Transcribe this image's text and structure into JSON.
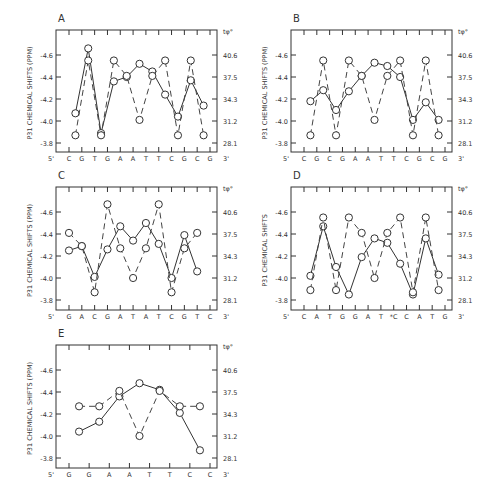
{
  "figure": {
    "left_axis_ticks": [
      "-4.6",
      "-4.4",
      "-4.2",
      "-4.0",
      "-3.8"
    ],
    "right_axis_ticks": [
      "40.6",
      "37.5",
      "34.3",
      "31.2",
      "28.1"
    ],
    "right_axis_label": "tφ°",
    "five_prime": "5'",
    "three_prime": "3'"
  },
  "chart_data": [
    {
      "type": "line",
      "panel": "A",
      "title": "A",
      "ylabel": "P31 CHEMICAL SHIFTS (PPM)",
      "y2label": "tφ°",
      "ylim": [
        -3.75,
        -4.72
      ],
      "y2ticks": [
        40.6,
        37.5,
        34.3,
        31.2,
        28.1
      ],
      "categories": [
        "C",
        "G",
        "T",
        "G",
        "A",
        "A",
        "T",
        "T",
        "C",
        "G",
        "C",
        "G"
      ],
      "series": [
        {
          "name": "P31 chemical shift",
          "style": "solid",
          "x": [
            0.5,
            1.5,
            2.5,
            3.5,
            4.5,
            5.5,
            6.5,
            7.5,
            8.5,
            9.5,
            10.5
          ],
          "values": [
            -4.07,
            -4.66,
            -3.89,
            -4.36,
            -4.4,
            -4.52,
            -4.45,
            -4.24,
            -4.04,
            -4.37,
            -4.14
          ]
        },
        {
          "name": "torsion angle",
          "style": "dashed",
          "x": [
            0.5,
            1.5,
            2.5,
            3.5,
            4.5,
            5.5,
            6.5,
            7.5,
            8.5,
            9.5,
            10.5
          ],
          "values": [
            -3.87,
            -4.55,
            -3.87,
            -4.55,
            -4.41,
            -4.01,
            -4.41,
            -4.55,
            -3.87,
            -4.55,
            -3.87
          ]
        }
      ]
    },
    {
      "type": "line",
      "panel": "B",
      "title": "B",
      "ylabel": "P31 CHEMICAL SHIFTS (PPM)",
      "y2label": "tφ°",
      "ylim": [
        -3.75,
        -4.72
      ],
      "y2ticks": [
        40.6,
        37.5,
        34.3,
        31.2,
        28.1
      ],
      "categories": [
        "C",
        "G",
        "C",
        "G",
        "A",
        "A",
        "T",
        "T",
        "C",
        "G",
        "C",
        "G"
      ],
      "series": [
        {
          "name": "P31 chemical shift",
          "style": "solid",
          "x": [
            0.5,
            1.5,
            2.5,
            3.5,
            4.5,
            5.5,
            6.5,
            7.5,
            8.5,
            9.5,
            10.5
          ],
          "values": [
            -4.18,
            -4.28,
            -4.1,
            -4.27,
            -4.41,
            -4.53,
            -4.5,
            -4.4,
            -4.01,
            -4.17,
            -4.01
          ]
        },
        {
          "name": "torsion angle",
          "style": "dashed",
          "x": [
            0.5,
            1.5,
            2.5,
            3.5,
            4.5,
            5.5,
            6.5,
            7.5,
            8.5,
            9.5,
            10.5
          ],
          "values": [
            -3.87,
            -4.55,
            -3.87,
            -4.55,
            -4.41,
            -4.01,
            -4.41,
            -4.55,
            -3.87,
            -4.55,
            -3.87
          ]
        }
      ]
    },
    {
      "type": "line",
      "panel": "C",
      "title": "C",
      "ylabel": "P31 CHEMICAL SHIFTS (PPM)",
      "y2label": "tφ°",
      "ylim": [
        -3.75,
        -4.72
      ],
      "y2ticks": [
        40.6,
        37.5,
        34.3,
        31.2,
        28.1
      ],
      "categories": [
        "G",
        "A",
        "C",
        "G",
        "A",
        "T",
        "A",
        "T",
        "C",
        "G",
        "T",
        "C"
      ],
      "series": [
        {
          "name": "P31 chemical shift",
          "style": "solid",
          "x": [
            0,
            1,
            2,
            3,
            4,
            5,
            6,
            7,
            8,
            9,
            10,
            11
          ],
          "values": [
            -4.25,
            -4.29,
            -4.01,
            -4.26,
            -4.47,
            -4.34,
            -4.5,
            -4.31,
            -4.0,
            -4.39,
            -4.06
          ]
        },
        {
          "name": "torsion angle",
          "style": "dashed",
          "x": [
            0,
            1,
            2,
            3,
            4,
            5,
            6,
            7,
            8,
            9,
            10,
            11
          ],
          "values": [
            -4.41,
            -4.29,
            -3.87,
            -4.67,
            -4.27,
            -4.0,
            -4.27,
            -4.67,
            -3.87,
            -4.27,
            -4.41
          ]
        }
      ]
    },
    {
      "type": "line",
      "panel": "D",
      "title": "D",
      "ylabel": "P31 CHEMICAL SHIFTS",
      "y2label": "tφ°",
      "ylim": [
        -3.75,
        -4.72
      ],
      "y2ticks": [
        40.6,
        37.5,
        34.3,
        31.2,
        28.1
      ],
      "categories": [
        "C",
        "A",
        "T",
        "G",
        "G",
        "A",
        "T",
        "*C",
        "C",
        "A",
        "T",
        "G"
      ],
      "series": [
        {
          "name": "P31 chemical shift",
          "style": "solid",
          "x": [
            0.5,
            1.5,
            2.5,
            3.5,
            4.5,
            5.5,
            6.5,
            7.5,
            8.5,
            9.5,
            10.5
          ],
          "values": [
            -4.02,
            -4.47,
            -4.1,
            -3.85,
            -4.19,
            -4.36,
            -4.32,
            -4.13,
            -3.85,
            -4.36,
            -4.03
          ]
        },
        {
          "name": "torsion angle",
          "style": "dashed",
          "x": [
            0.5,
            1.5,
            2.5,
            3.5,
            4.5,
            5.5,
            6.5,
            7.5,
            8.5,
            9.5,
            10.5
          ],
          "values": [
            -3.89,
            -4.55,
            -3.89,
            -4.55,
            -4.41,
            -4.0,
            -4.41,
            -4.55,
            -3.87,
            -4.55,
            -3.89
          ]
        }
      ]
    },
    {
      "type": "line",
      "panel": "E",
      "title": "E",
      "ylabel": "P31 CHEMICAL SHIFTS (PPM)",
      "y2label": "tφ°",
      "ylim": [
        -3.75,
        -4.72
      ],
      "y2ticks": [
        40.6,
        37.5,
        34.3,
        31.2,
        28.1
      ],
      "categories": [
        "G",
        "G",
        "A",
        "A",
        "T",
        "T",
        "C",
        "C"
      ],
      "series": [
        {
          "name": "P31 chemical shift",
          "style": "solid",
          "x": [
            0.5,
            1.5,
            2.5,
            3.5,
            4.5,
            5.5,
            6.5
          ],
          "values": [
            -4.04,
            -4.13,
            -4.36,
            -4.48,
            -4.42,
            -4.21,
            -3.87
          ]
        },
        {
          "name": "torsion angle",
          "style": "dashed",
          "x": [
            0.5,
            1.5,
            2.5,
            3.5,
            4.5,
            5.5,
            6.5
          ],
          "values": [
            -4.27,
            -4.27,
            -4.41,
            -4.0,
            -4.41,
            -4.27,
            -4.27
          ]
        }
      ]
    }
  ]
}
